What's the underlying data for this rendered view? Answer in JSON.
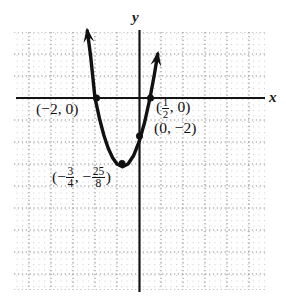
{
  "figure": {
    "kind": "coordinate-plane-graph",
    "background_color": "#ffffff",
    "grid": {
      "visible": true,
      "style": "dotted",
      "minor_dot_color": "#cfcfcf",
      "major_line_color": "#8c8c8c",
      "left_px": 14,
      "top_px": 32,
      "right_px": 267,
      "bottom_px": 290,
      "major_spacing_px": 22,
      "minor_spacing_px": 5.5
    },
    "axes": {
      "color": "#111111",
      "x_axis_y_px": 98,
      "y_axis_x_px": 139,
      "x_label": "x",
      "y_label": "y"
    }
  },
  "chart_data": {
    "type": "line",
    "title": "",
    "subtitle": "",
    "xlabel": "x",
    "ylabel": "y",
    "grid": true,
    "legend": null,
    "curve_label": "",
    "equation": "y = 2x^2 + 3x - 2",
    "curve_style": {
      "color": "#111111",
      "width_px": 3.4,
      "arrowheads": "both-ends-upward"
    },
    "xlim": [
      -5.75,
      5.8
    ],
    "ylim": [
      -8.75,
      3.0
    ],
    "xtick_step": 1,
    "ytick_step": 1,
    "xticklabels": [],
    "yticklabels": [],
    "x": [
      -2.35,
      -2.2,
      -2.0,
      -1.8,
      -1.6,
      -1.4,
      -1.2,
      -1.0,
      -0.75,
      -0.5,
      -0.25,
      0.0,
      0.25,
      0.5,
      0.7,
      0.85
    ],
    "y": [
      3.05,
      1.92,
      0.0,
      -0.92,
      -1.68,
      -2.28,
      -2.72,
      -3.0,
      -3.125,
      -3.0,
      -2.625,
      -2.0,
      -1.125,
      0.0,
      1.08,
      1.99
    ],
    "annotations": [
      {
        "name": "x-intercept-left",
        "text": "(−2, 0)",
        "point": [
          -2,
          0
        ],
        "marker": "filled-dot",
        "label_x_px": 36,
        "label_y_px": 108
      },
      {
        "name": "x-intercept-right",
        "text_prefix": "(",
        "text_numerator": "1",
        "text_denominator": "2",
        "text_suffix": ", 0)",
        "point": [
          0.5,
          0
        ],
        "marker": "filled-dot",
        "label_x_px": 157,
        "label_y_px": 104
      },
      {
        "name": "y-intercept",
        "text": "(0, −2)",
        "point": [
          0,
          -2
        ],
        "marker": "filled-dot",
        "label_x_px": 154,
        "label_y_px": 127
      },
      {
        "name": "vertex",
        "text_parts": [
          "(−",
          "3",
          "4",
          ", −",
          "25",
          "8",
          ")"
        ],
        "point": [
          -0.75,
          -3.125
        ],
        "marker": "filled-dot",
        "label_x_px": 52,
        "label_y_px": 168
      }
    ],
    "markers": [
      {
        "name": "x-intercept-left-dot",
        "px": [
          96.5,
          98
        ]
      },
      {
        "name": "x-intercept-right-dot",
        "px": [
          150.5,
          98
        ]
      },
      {
        "name": "y-intercept-dot",
        "px": [
          139.5,
          136
        ]
      },
      {
        "name": "vertex-dot",
        "px": [
          122,
          163.5
        ]
      }
    ]
  }
}
